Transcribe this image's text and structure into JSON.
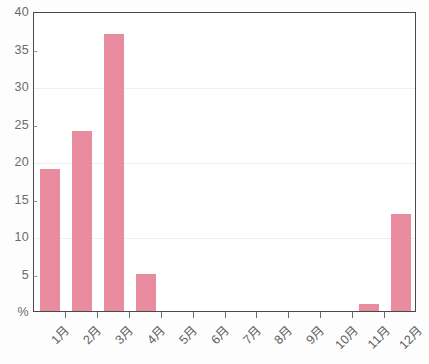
{
  "chart_data": {
    "type": "bar",
    "title": "",
    "subtitle": "",
    "xlabel": "",
    "ylabel": "%",
    "categories": [
      "1月",
      "2月",
      "3月",
      "4月",
      "5月",
      "6月",
      "7月",
      "8月",
      "9月",
      "10月",
      "11月",
      "12月"
    ],
    "values": [
      19,
      24,
      37,
      5,
      0,
      0,
      0,
      0,
      0,
      0,
      1,
      13
    ],
    "ylim": [
      0,
      40
    ],
    "ytick_values": [
      0,
      5,
      10,
      15,
      20,
      25,
      30,
      35,
      40
    ],
    "ytick_labels": [
      "%",
      "5",
      "10",
      "15",
      "20",
      "25",
      "30",
      "35",
      "40"
    ],
    "gridline_values": [
      10,
      20,
      30
    ],
    "grid": true,
    "legend": false,
    "legend_position": "none",
    "bar_color": "#e98c9f",
    "axis_color": "#4a4a4a",
    "grid_color": "#f0eeee",
    "tick_label_color": "#6b6b6b",
    "xtick_label_rotation": -45
  }
}
